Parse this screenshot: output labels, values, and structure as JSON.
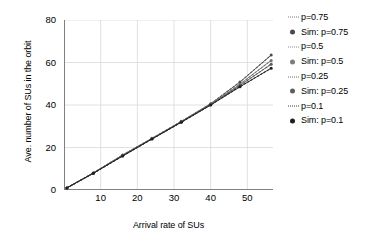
{
  "chart_data": {
    "type": "line",
    "title": "",
    "xlabel": "Arrival rate of SUs",
    "ylabel": "Ave. number of SUs in the orbit",
    "xlim": [
      0,
      57
    ],
    "ylim": [
      0,
      80
    ],
    "xticks": [
      10,
      20,
      30,
      40,
      50
    ],
    "yticks": [
      0,
      20,
      40,
      60,
      80
    ],
    "grid": true,
    "legend_position": "right",
    "x": [
      0.8,
      8,
      16,
      24,
      32,
      40,
      48,
      56.5
    ],
    "series": [
      {
        "name": "p=0.75",
        "style": "dotted",
        "color": "#7a7a7a",
        "values": [
          1.0,
          8.0,
          16.5,
          24.3,
          32.3,
          40.6,
          50.8,
          63.5
        ]
      },
      {
        "name": "Sim: p=0.75",
        "style": "markers",
        "color": "#4a4a4a",
        "values": [
          1.0,
          8.0,
          16.5,
          24.3,
          32.3,
          40.6,
          50.8,
          63.5
        ]
      },
      {
        "name": "p=0.5",
        "style": "dotted",
        "color": "#8a8a8a",
        "values": [
          1.0,
          8.0,
          16.3,
          24.2,
          32.1,
          40.3,
          49.8,
          61.0
        ]
      },
      {
        "name": "Sim: p=0.5",
        "style": "markers",
        "color": "#6e6e6e",
        "values": [
          1.0,
          8.0,
          16.3,
          24.2,
          32.1,
          40.3,
          49.8,
          61.0
        ]
      },
      {
        "name": "p=0.25",
        "style": "dotted",
        "color": "#6b6b6b",
        "values": [
          1.0,
          7.9,
          16.1,
          24.1,
          32.0,
          40.1,
          49.2,
          59.2
        ]
      },
      {
        "name": "Sim: p=0.25",
        "style": "markers",
        "color": "#595959",
        "values": [
          1.0,
          7.9,
          16.1,
          24.1,
          32.0,
          40.1,
          49.2,
          59.2
        ]
      },
      {
        "name": "p=0.1",
        "style": "dotted",
        "color": "#3a3a3a",
        "values": [
          1.0,
          7.9,
          16.0,
          24.0,
          31.9,
          40.0,
          48.6,
          57.3
        ]
      },
      {
        "name": "Sim: p=0.1",
        "style": "markers",
        "color": "#1f1f1f",
        "values": [
          1.0,
          7.9,
          16.0,
          24.0,
          31.9,
          40.0,
          48.6,
          57.3
        ]
      }
    ]
  },
  "axes": {
    "x_title": "Arrival rate of SUs",
    "y_title": "Ave. number of SUs in the orbit",
    "x_tick_labels": [
      "10",
      "20",
      "30",
      "40",
      "50"
    ],
    "y_tick_labels": [
      "0",
      "20",
      "40",
      "60",
      "80"
    ]
  },
  "legend": {
    "items": [
      {
        "label": "p=0.75",
        "marker": "dotted-line-icon",
        "color": "#7a7a7a"
      },
      {
        "label": "Sim: p=0.75",
        "marker": "filled-circle-icon",
        "color": "#4a4a4a"
      },
      {
        "label": "p=0.5",
        "marker": "dotted-line-icon",
        "color": "#8a8a8a"
      },
      {
        "label": "Sim: p=0.5",
        "marker": "filled-circle-icon",
        "color": "#7d7d7d"
      },
      {
        "label": "p=0.25",
        "marker": "dotted-line-icon",
        "color": "#6b6b6b"
      },
      {
        "label": "Sim: p=0.25",
        "marker": "filled-circle-icon",
        "color": "#5e5e5e"
      },
      {
        "label": "p=0.1",
        "marker": "dotted-line-icon",
        "color": "#3a3a3a"
      },
      {
        "label": "Sim: p=0.1",
        "marker": "filled-circle-icon",
        "color": "#1f1f1f"
      }
    ]
  },
  "colors": {
    "axis": "#808080",
    "grid": "#d9d9d9",
    "text": "#000000",
    "background": "#ffffff"
  }
}
